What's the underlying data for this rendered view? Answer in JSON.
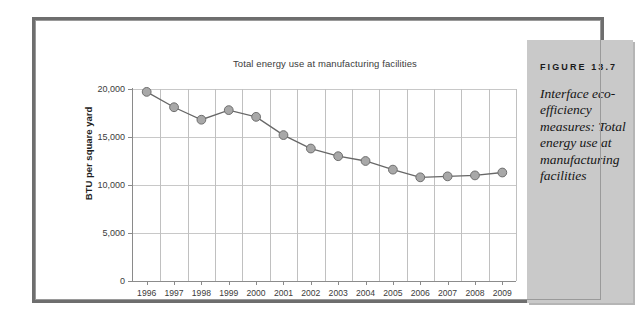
{
  "figure": {
    "label": "FIGURE 13.7",
    "caption": "Interface eco-efficiency measures: Total energy use at manufacturing facilities"
  },
  "chart_data": {
    "type": "line",
    "title": "Total energy use at manufacturing facilities",
    "xlabel": "",
    "ylabel": "BTU per square yard",
    "categories": [
      "1996",
      "1997",
      "1998",
      "1999",
      "2000",
      "2001",
      "2002",
      "2003",
      "2004",
      "2005",
      "2006",
      "2007",
      "2008",
      "2009"
    ],
    "values": [
      19700,
      18100,
      16800,
      17800,
      17100,
      15200,
      13800,
      13000,
      12500,
      11600,
      10800,
      10900,
      11000,
      11300
    ],
    "ylim": [
      0,
      20000
    ],
    "ytick_labels": [
      "20,000",
      "15,000",
      "10,000",
      "5,000",
      "0"
    ],
    "ytick_values": [
      20000,
      15000,
      10000,
      5000,
      0
    ],
    "grid": true,
    "legend": "none",
    "marker": "circle",
    "marker_color": "#a8a8a8",
    "marker_edge_color": "#6f6f6f",
    "line_color": "#676767"
  }
}
